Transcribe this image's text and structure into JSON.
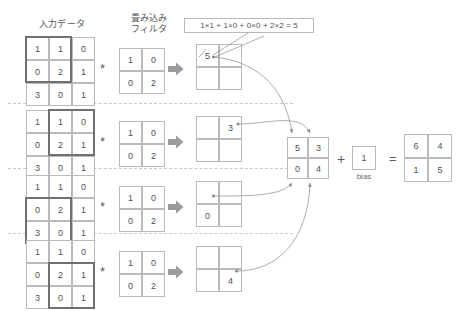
{
  "headings": {
    "input": "入力データ",
    "filter": "畳み込み\nフィルタ",
    "bias": "bias"
  },
  "operators": {
    "convolve": "*",
    "plus": "+",
    "equals": "="
  },
  "formula": {
    "text": "1×1 + 1×0 + 0×0 + 2×2 = 5"
  },
  "input_matrix": {
    "rows": [
      [
        "1",
        "1",
        "0"
      ],
      [
        "0",
        "2",
        "1"
      ],
      [
        "3",
        "0",
        "1"
      ]
    ]
  },
  "filter_matrix": {
    "rows": [
      [
        "1",
        "0"
      ],
      [
        "0",
        "2"
      ]
    ]
  },
  "steps": [
    {
      "name": "step-top-left",
      "window": "top-left",
      "input": [
        [
          "1",
          "1",
          "0"
        ],
        [
          "0",
          "2",
          "1"
        ],
        [
          "3",
          "0",
          "1"
        ]
      ],
      "filter": [
        [
          "1",
          "0"
        ],
        [
          "0",
          "2"
        ]
      ],
      "output": [
        [
          "5",
          ""
        ],
        [
          "",
          ""
        ]
      ],
      "result_value": "5"
    },
    {
      "name": "step-top-right",
      "window": "top-right",
      "input": [
        [
          "1",
          "1",
          "0"
        ],
        [
          "0",
          "2",
          "1"
        ],
        [
          "3",
          "0",
          "1"
        ]
      ],
      "filter": [
        [
          "1",
          "0"
        ],
        [
          "0",
          "2"
        ]
      ],
      "output": [
        [
          "",
          "3"
        ],
        [
          "",
          ""
        ]
      ],
      "result_value": "3"
    },
    {
      "name": "step-bottom-left",
      "window": "bottom-left",
      "input": [
        [
          "1",
          "1",
          "0"
        ],
        [
          "0",
          "2",
          "1"
        ],
        [
          "3",
          "0",
          "1"
        ]
      ],
      "filter": [
        [
          "1",
          "0"
        ],
        [
          "0",
          "2"
        ]
      ],
      "output": [
        [
          "",
          ""
        ],
        [
          "0",
          ""
        ]
      ],
      "result_value": "0"
    },
    {
      "name": "step-bottom-right",
      "window": "bottom-right",
      "input": [
        [
          "1",
          "1",
          "0"
        ],
        [
          "0",
          "2",
          "1"
        ],
        [
          "3",
          "0",
          "1"
        ]
      ],
      "filter": [
        [
          "1",
          "0"
        ],
        [
          "0",
          "2"
        ]
      ],
      "output": [
        [
          "",
          ""
        ],
        [
          "",
          "4"
        ]
      ],
      "result_value": "4"
    }
  ],
  "conv_output": {
    "rows": [
      [
        "5",
        "3"
      ],
      [
        "0",
        "4"
      ]
    ]
  },
  "bias": {
    "value": "1",
    "label": "bias"
  },
  "final_result": {
    "rows": [
      [
        "6",
        "4"
      ],
      [
        "1",
        "5"
      ]
    ]
  },
  "colors": {
    "grid_line": "#b9babd",
    "text": "#4f5053",
    "highlight": "#6f7073",
    "arrow_fill": "#9a9b9e",
    "separator": "#c9cacd"
  }
}
